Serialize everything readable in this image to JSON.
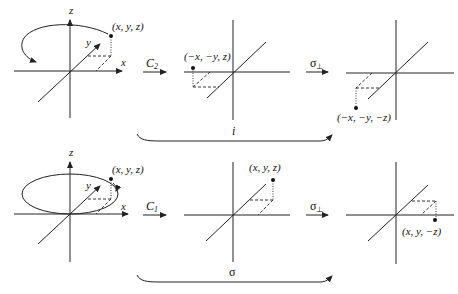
{
  "top_row": {
    "start": {
      "axes": {
        "z": "z",
        "y": "y",
        "x": "x"
      },
      "point": "(x, y, z)"
    },
    "op1": {
      "label": "C",
      "sub": "2"
    },
    "mid": {
      "point": "(−x, −y, z)"
    },
    "op2": {
      "label": "σ",
      "sub": "⊥"
    },
    "end": {
      "point": "(−x, −y, −z)"
    },
    "composite": "i"
  },
  "bottom_row": {
    "start": {
      "axes": {
        "z": "z",
        "y": "y",
        "x": "x"
      },
      "point": "(x, y, z)"
    },
    "op1": {
      "label": "C",
      "sub": "1"
    },
    "mid": {
      "point": "(x, y, z)"
    },
    "op2": {
      "label": "σ",
      "sub": "⊥"
    },
    "end": {
      "point": "(x, y, −z)"
    },
    "composite": "σ"
  }
}
